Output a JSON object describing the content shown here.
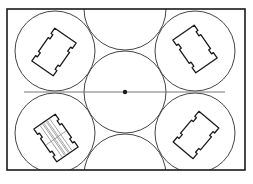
{
  "diagram": {
    "type": "circle-packing-layout",
    "canvas": {
      "width": 253,
      "height": 184,
      "background": "#ffffff"
    },
    "colors": {
      "stroke": "#1a1a1a",
      "thin_stroke": "#444444",
      "axis_line": "#777777",
      "hatch": "#888888"
    },
    "frame": {
      "x": 7,
      "y": 9,
      "width": 238,
      "height": 161,
      "stroke_width": 1.6
    },
    "axis_line": {
      "x1": 24,
      "y1": 92,
      "x2": 225,
      "y2": 92
    },
    "center_point": {
      "cx": 125,
      "cy": 92,
      "r": 2.2
    },
    "circles": [
      {
        "id": "top-left",
        "cx": 55,
        "cy": 51,
        "r": 40
      },
      {
        "id": "bottom-left",
        "cx": 55,
        "cy": 133,
        "r": 40
      },
      {
        "id": "top-right",
        "cx": 195,
        "cy": 51,
        "r": 40
      },
      {
        "id": "bottom-right",
        "cx": 195,
        "cy": 133,
        "r": 40
      },
      {
        "id": "center",
        "cx": 125,
        "cy": 92,
        "r": 41
      },
      {
        "id": "top-middle-partial",
        "cx": 125,
        "cy": 9,
        "r": 41
      },
      {
        "id": "bottom-middle-partial",
        "cx": 125,
        "cy": 175,
        "r": 41
      }
    ],
    "chips": [
      {
        "id": "chip-top-left",
        "cx": 54,
        "cy": 52,
        "w": 26,
        "h": 40,
        "angle": 35,
        "hatched": false
      },
      {
        "id": "chip-top-right",
        "cx": 195,
        "cy": 49,
        "w": 26,
        "h": 40,
        "angle": -35,
        "hatched": false
      },
      {
        "id": "chip-bottom-left",
        "cx": 56,
        "cy": 138,
        "w": 26,
        "h": 40,
        "angle": -35,
        "hatched": true
      },
      {
        "id": "chip-bottom-right",
        "cx": 196,
        "cy": 135,
        "w": 26,
        "h": 40,
        "angle": 40,
        "hatched": false
      }
    ]
  }
}
